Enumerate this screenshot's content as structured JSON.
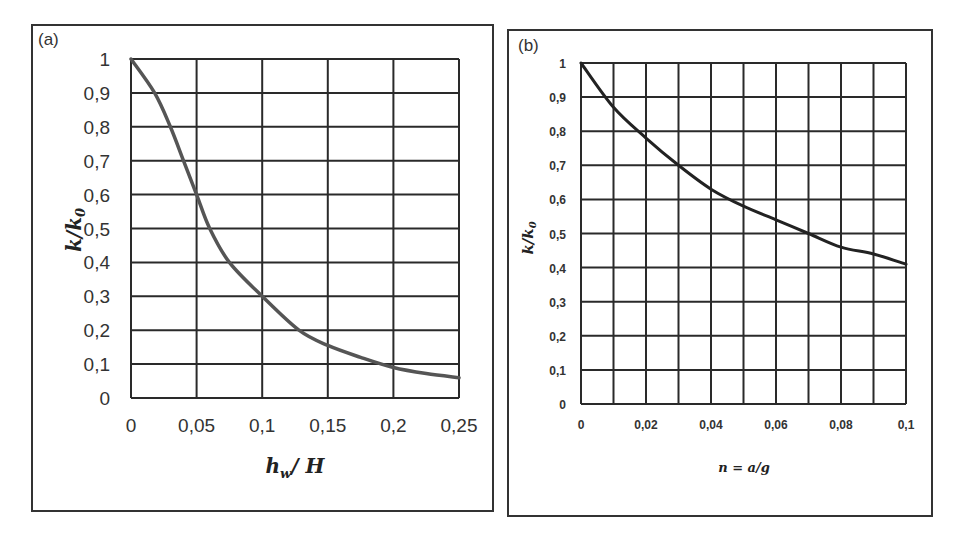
{
  "panels": {
    "a": {
      "label": "(a)"
    },
    "b": {
      "label": "(b)"
    }
  },
  "chart_data": [
    {
      "type": "line",
      "panel": "(a)",
      "title": "",
      "xlabel": "h_w / H",
      "ylabel": "k/k_0",
      "xlim": [
        0,
        0.25
      ],
      "ylim": [
        0,
        1
      ],
      "grid": true,
      "xticks": [
        "0",
        "0,05",
        "0,1",
        "0,15",
        "0,2",
        "0,25"
      ],
      "yticks": [
        "0",
        "0,1",
        "0,2",
        "0,3",
        "0,4",
        "0,5",
        "0,6",
        "0,7",
        "0,8",
        "0,9",
        "1"
      ],
      "line_color": "#555555",
      "x": [
        0,
        0.018,
        0.03,
        0.04,
        0.05,
        0.06,
        0.075,
        0.1,
        0.128,
        0.15,
        0.175,
        0.2,
        0.225,
        0.25
      ],
      "series": [
        {
          "name": "k/k0",
          "values": [
            1.0,
            0.9,
            0.8,
            0.7,
            0.6,
            0.5,
            0.4,
            0.3,
            0.2,
            0.155,
            0.12,
            0.09,
            0.072,
            0.06
          ]
        }
      ]
    },
    {
      "type": "line",
      "panel": "(b)",
      "title": "",
      "xlabel": "n = a/g",
      "ylabel": "k/k_0",
      "xlim": [
        0,
        0.1
      ],
      "ylim": [
        0,
        1
      ],
      "grid": true,
      "xticks": [
        "0",
        "0,02",
        "0,04",
        "0,06",
        "0,08",
        "0,1"
      ],
      "yticks": [
        "0",
        "0,1",
        "0,2",
        "0,3",
        "0,4",
        "0,5",
        "0,6",
        "0,7",
        "0,8",
        "0,9",
        "1"
      ],
      "line_color": "#222222",
      "x": [
        0,
        0.01,
        0.02,
        0.03,
        0.04,
        0.05,
        0.06,
        0.07,
        0.08,
        0.09,
        0.1
      ],
      "series": [
        {
          "name": "k/k0",
          "values": [
            1.0,
            0.87,
            0.78,
            0.7,
            0.63,
            0.58,
            0.54,
            0.5,
            0.46,
            0.44,
            0.41
          ]
        }
      ]
    }
  ]
}
